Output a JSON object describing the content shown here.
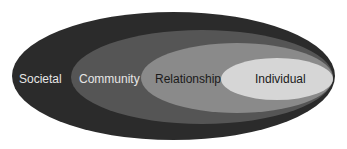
{
  "diagram": {
    "type": "nested-ellipses",
    "levels": [
      {
        "label": "Societal",
        "fill": "#2b2b2b",
        "text_color": "#e6e6e6"
      },
      {
        "label": "Community",
        "fill": "#555555",
        "text_color": "#e6e6e6"
      },
      {
        "label": "Relationship",
        "fill": "#8a8a8a",
        "text_color": "#1a1a1a"
      },
      {
        "label": "Individual",
        "fill": "#d6d6d6",
        "text_color": "#1a1a1a"
      }
    ]
  }
}
